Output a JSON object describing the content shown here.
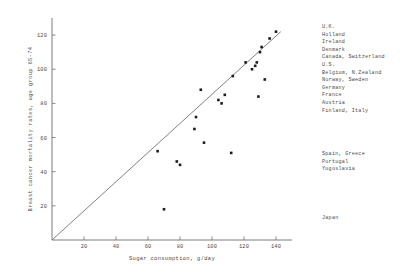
{
  "chart_data": {
    "type": "scatter",
    "title": "",
    "xlabel": "Sugar consumption, g/day",
    "ylabel": "Breast cancer mortality rates, age group 65-74",
    "xlim": [
      0,
      150
    ],
    "ylim": [
      0,
      130
    ],
    "xticks": [
      20,
      40,
      60,
      80,
      100,
      120,
      140
    ],
    "yticks": [
      20,
      40,
      60,
      80,
      100,
      120
    ],
    "grid": false,
    "legend_position": "right",
    "points": [
      {
        "x": 140,
        "y": 122,
        "label": "U.K."
      },
      {
        "x": 136,
        "y": 118,
        "label": "Holland"
      },
      {
        "x": 131,
        "y": 113,
        "label": "Ireland"
      },
      {
        "x": 130,
        "y": 110,
        "label": "Denmark"
      },
      {
        "x": 128,
        "y": 104,
        "label": "Canada, Switzerland"
      },
      {
        "x": 127,
        "y": 102,
        "label": "U.S."
      },
      {
        "x": 125,
        "y": 100,
        "label": "Belgium, N.Zealand"
      },
      {
        "x": 121,
        "y": 104,
        "label": "Norway, Sweden"
      },
      {
        "x": 133,
        "y": 94,
        "label": "Germany"
      },
      {
        "x": 113,
        "y": 96,
        "label": "France"
      },
      {
        "x": 129,
        "y": 84,
        "label": "Austria"
      },
      {
        "x": 108,
        "y": 85,
        "label": "Finland, Italy"
      },
      {
        "x": 104,
        "y": 82,
        "label": ""
      },
      {
        "x": 106,
        "y": 80,
        "label": ""
      },
      {
        "x": 93,
        "y": 88,
        "label": ""
      },
      {
        "x": 90,
        "y": 72,
        "label": ""
      },
      {
        "x": 89,
        "y": 65,
        "label": ""
      },
      {
        "x": 95,
        "y": 57,
        "label": ""
      },
      {
        "x": 112,
        "y": 51,
        "label": "Spain, Greece"
      },
      {
        "x": 66,
        "y": 52,
        "label": "Portugal"
      },
      {
        "x": 78,
        "y": 46,
        "label": "Yugoslavia"
      },
      {
        "x": 80,
        "y": 44,
        "label": ""
      },
      {
        "x": 70,
        "y": 18,
        "label": "Japan"
      }
    ],
    "fit_line": {
      "x0": 0,
      "y0": 0,
      "x1": 143,
      "y1": 122
    },
    "annotations_right": [
      "U.K.",
      "Holland",
      "Ireland",
      "Denmark",
      "Canada, Switzerland",
      "U.S.",
      "Belgium, N.Zealand",
      "Norway, Sweden",
      "Germany",
      "France",
      "Austria",
      "Finland, Italy"
    ],
    "annotations_mid": [
      "Spain, Greece",
      "Portugal",
      "Yugoslavia"
    ],
    "annotations_low": [
      "Japan"
    ]
  },
  "colors": {
    "point": "#1c1c1c",
    "axis": "#6e6e6e",
    "fit": "#6a6a6a",
    "text": "#4a4a4a",
    "background": "#ffffff"
  }
}
